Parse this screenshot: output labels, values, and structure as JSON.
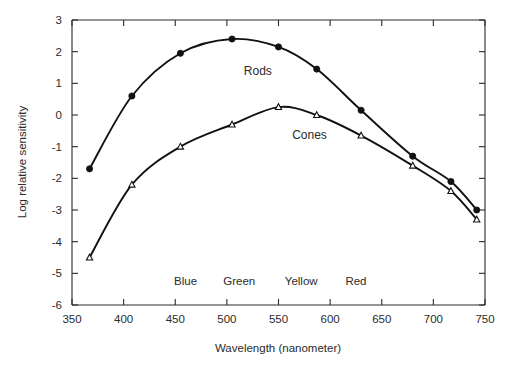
{
  "chart_data": {
    "type": "line",
    "title": "",
    "xlabel": "Wavelength (nanometer)",
    "ylabel": "Log relative sensitivity",
    "xlim": [
      350,
      750
    ],
    "ylim": [
      -6,
      3
    ],
    "xticks": [
      350,
      400,
      450,
      500,
      550,
      600,
      650,
      700,
      750
    ],
    "xtick_labels": [
      "350",
      "400",
      "450",
      "500",
      "550",
      "600",
      "650",
      "700",
      "750"
    ],
    "yticks": [
      3,
      2,
      1,
      0,
      -1,
      -2,
      -3,
      -4,
      -5,
      -6
    ],
    "ytick_labels": [
      "3",
      "2",
      "1",
      "0",
      "-1",
      "-2",
      "-3",
      "-4",
      "-5",
      "-6"
    ],
    "grid": false,
    "legend_position": "inline-annotation",
    "series": [
      {
        "name": "Rods",
        "marker": "filled-circle",
        "x": [
          367,
          408,
          455,
          505,
          550,
          587,
          630,
          680,
          717,
          742
        ],
        "values": [
          -1.7,
          0.6,
          1.95,
          2.4,
          2.15,
          1.45,
          0.15,
          -1.3,
          -2.1,
          -3.0
        ]
      },
      {
        "name": "Cones",
        "marker": "open-triangle",
        "x": [
          367,
          408,
          455,
          505,
          550,
          587,
          630,
          680,
          717,
          742
        ],
        "values": [
          -4.5,
          -2.2,
          -1.0,
          -0.3,
          0.25,
          0.0,
          -0.65,
          -1.6,
          -2.4,
          -3.3
        ]
      }
    ],
    "annotations": [
      {
        "text": "Rods",
        "x": 530,
        "y": 1.25
      },
      {
        "text": "Cones",
        "x": 580,
        "y": -0.75
      }
    ],
    "band_labels": [
      {
        "text": "Blue",
        "x": 460
      },
      {
        "text": "Green",
        "x": 512
      },
      {
        "text": "Yellow",
        "x": 572
      },
      {
        "text": "Red",
        "x": 625
      }
    ]
  }
}
